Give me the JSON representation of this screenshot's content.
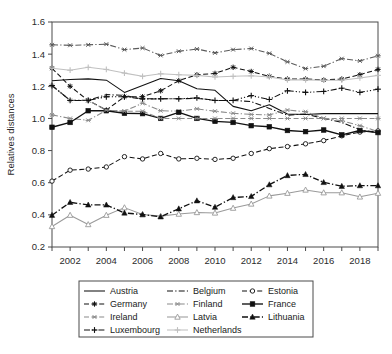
{
  "chart_data": {
    "type": "line",
    "title": "",
    "xlabel": "",
    "ylabel": "Relatives distances",
    "ylim": [
      0.2,
      1.6
    ],
    "yticks": [
      "0.2",
      "0.4",
      "0.6",
      "0.8",
      "1.0",
      "1.2",
      "1.4",
      "1.6"
    ],
    "ytick_values": [
      0.2,
      0.4,
      0.6,
      0.8,
      1.0,
      1.2,
      1.4,
      1.6
    ],
    "xlim": [
      2001,
      2019
    ],
    "xticks": [
      "2002",
      "2004",
      "2006",
      "2008",
      "2010",
      "2012",
      "2014",
      "2016",
      "2018"
    ],
    "xtick_values": [
      2002,
      2004,
      2006,
      2008,
      2010,
      2012,
      2014,
      2016,
      2018
    ],
    "x": [
      2001,
      2002,
      2003,
      2004,
      2005,
      2006,
      2007,
      2008,
      2009,
      2010,
      2011,
      2012,
      2013,
      2014,
      2015,
      2016,
      2017,
      2018,
      2019
    ],
    "grid": false,
    "legend_position": "below-center",
    "legend_columns": 3,
    "series": [
      {
        "name": "Austria",
        "color": "#111111",
        "dash": "none",
        "marker": "none",
        "values": [
          1.235,
          1.242,
          1.246,
          1.238,
          1.162,
          1.205,
          1.248,
          1.235,
          1.185,
          1.175,
          1.075,
          1.048,
          1.085,
          1.028,
          1.025,
          1.03,
          1.03,
          1.03,
          1.03
        ]
      },
      {
        "name": "Belgium",
        "color": "#111111",
        "dash": "dashdot",
        "marker": "none",
        "values": [
          1.205,
          1.112,
          1.113,
          1.148,
          1.144,
          1.12,
          1.122,
          1.122,
          1.125,
          1.112,
          1.112,
          1.105,
          1.062,
          1.02,
          1.028,
          1.0,
          0.975,
          0.93,
          0.91
        ]
      },
      {
        "name": "Estonia",
        "color": "#111111",
        "dash": "dashed",
        "marker": "circle-open",
        "values": [
          0.61,
          0.678,
          0.685,
          0.698,
          0.762,
          0.748,
          0.782,
          0.748,
          0.752,
          0.745,
          0.752,
          0.782,
          0.812,
          0.825,
          0.842,
          0.862,
          0.892,
          0.915,
          0.922
        ]
      },
      {
        "name": "Germany",
        "color": "#111111",
        "dash": "dashed",
        "marker": "star",
        "values": [
          1.312,
          1.2,
          1.112,
          1.052,
          1.135,
          1.135,
          1.172,
          1.235,
          1.272,
          1.28,
          1.318,
          1.292,
          1.262,
          1.245,
          1.245,
          1.24,
          1.245,
          1.272,
          1.305
        ]
      },
      {
        "name": "Finland",
        "color": "#8a8a8a",
        "dash": "dashdot",
        "marker": "asterisk",
        "values": [
          1.022,
          1.0,
          0.988,
          1.05,
          1.045,
          1.095,
          1.048,
          1.045,
          1.06,
          1.045,
          1.032,
          1.025,
          1.022,
          1.052,
          1.042,
          1.0,
          0.985,
          0.955,
          0.918
        ]
      },
      {
        "name": "France",
        "color": "#111111",
        "dash": "none",
        "marker": "square-filled",
        "values": [
          0.945,
          0.975,
          1.048,
          1.048,
          1.032,
          1.03,
          1.0,
          1.038,
          1.0,
          0.982,
          0.975,
          0.955,
          0.948,
          0.925,
          0.918,
          0.928,
          0.898,
          0.925,
          0.912
        ]
      },
      {
        "name": "Ireland",
        "color": "#8a8a8a",
        "dash": "dashed",
        "marker": "asterisk",
        "values": [
          1.205,
          1.112,
          1.112,
          1.052,
          1.045,
          1.045,
          1.0,
          1.0,
          1.0,
          1.0,
          1.0,
          1.0,
          1.0,
          1.0,
          1.0,
          1.0,
          1.0,
          1.0,
          1.0
        ]
      },
      {
        "name": "Latvia",
        "color": "#9a9a9a",
        "dash": "solid",
        "marker": "triangle-open",
        "values": [
          0.328,
          0.398,
          0.34,
          0.398,
          0.445,
          0.402,
          0.392,
          0.405,
          0.415,
          0.412,
          0.442,
          0.468,
          0.518,
          0.535,
          0.555,
          0.538,
          0.538,
          0.512,
          0.535
        ]
      },
      {
        "name": "Lithuania",
        "color": "#111111",
        "dash": "dashdot",
        "marker": "triangle-filled",
        "values": [
          0.398,
          0.478,
          0.462,
          0.462,
          0.412,
          0.402,
          0.388,
          0.438,
          0.488,
          0.448,
          0.508,
          0.515,
          0.588,
          0.645,
          0.652,
          0.602,
          0.578,
          0.582,
          0.582
        ]
      },
      {
        "name": "Luxembourg",
        "color": "#111111",
        "dash": "dashdotdot",
        "marker": "plus",
        "values": [
          1.205,
          1.112,
          1.112,
          1.135,
          1.135,
          1.122,
          1.122,
          1.122,
          1.128,
          1.112,
          1.112,
          1.142,
          1.118,
          1.172,
          1.162,
          1.168,
          1.188,
          1.162,
          1.182
        ]
      },
      {
        "name": "Netherlands",
        "color": "#c0c0c0",
        "dash": "solid",
        "marker": "plus",
        "values": [
          1.312,
          1.3,
          1.318,
          1.305,
          1.282,
          1.262,
          1.278,
          1.272,
          1.268,
          1.258,
          1.262,
          1.265,
          1.258,
          1.24,
          1.24,
          1.238,
          1.238,
          1.252,
          1.268
        ]
      },
      {
        "name": "EstoniaTop",
        "color": "#5a5a5a",
        "dash": "dashdot",
        "marker": "asterisk",
        "values": [
          1.458,
          1.455,
          1.458,
          1.462,
          1.428,
          1.438,
          1.392,
          1.418,
          1.432,
          1.408,
          1.428,
          1.435,
          1.405,
          1.352,
          1.31,
          1.325,
          1.372,
          1.358,
          1.39
        ]
      }
    ],
    "legend_entries": [
      {
        "label": "Austria",
        "color": "#111111",
        "dash": "none",
        "marker": "none"
      },
      {
        "label": "Belgium",
        "color": "#111111",
        "dash": "dashdot",
        "marker": "none"
      },
      {
        "label": "Estonia",
        "color": "#111111",
        "dash": "dashed",
        "marker": "circle-open"
      },
      {
        "label": "Germany",
        "color": "#111111",
        "dash": "dashed",
        "marker": "star"
      },
      {
        "label": "Finland",
        "color": "#8a8a8a",
        "dash": "dashdot",
        "marker": "asterisk"
      },
      {
        "label": "France",
        "color": "#111111",
        "dash": "none",
        "marker": "square-filled"
      },
      {
        "label": "Ireland",
        "color": "#8a8a8a",
        "dash": "dashed",
        "marker": "asterisk"
      },
      {
        "label": "Latvia",
        "color": "#9a9a9a",
        "dash": "solid",
        "marker": "triangle-open"
      },
      {
        "label": "Lithuania",
        "color": "#111111",
        "dash": "dashdot",
        "marker": "triangle-filled"
      },
      {
        "label": "Luxembourg",
        "color": "#111111",
        "dash": "dashdotdot",
        "marker": "plus"
      },
      {
        "label": "Netherlands",
        "color": "#c0c0c0",
        "dash": "solid",
        "marker": "plus"
      }
    ]
  }
}
